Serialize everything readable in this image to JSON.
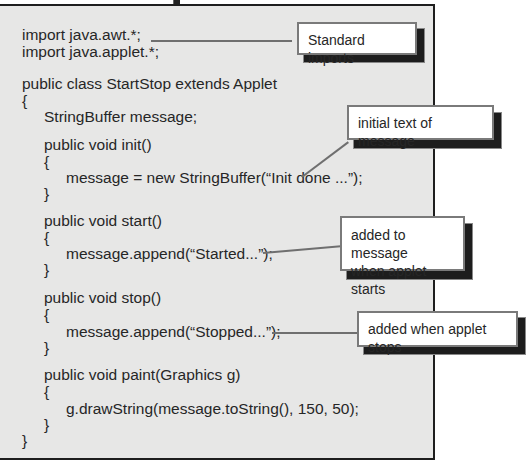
{
  "code": {
    "lines": [
      {
        "text": "import java.awt.*;",
        "indent": 0,
        "y": 35
      },
      {
        "text": "import java.applet.*;",
        "indent": 0,
        "y": 52
      },
      {
        "text": "public class StartStop extends Applet",
        "indent": 0,
        "y": 84
      },
      {
        "text": "{",
        "indent": 0,
        "y": 101
      },
      {
        "text": "StringBuffer message;",
        "indent": 1,
        "y": 117
      },
      {
        "text": "public void init()",
        "indent": 1,
        "y": 145
      },
      {
        "text": "{",
        "indent": 1,
        "y": 162
      },
      {
        "text": "message = new StringBuffer(“Init done ...”);",
        "indent": 2,
        "y": 178
      },
      {
        "text": "}",
        "indent": 1,
        "y": 194
      },
      {
        "text": "public void start()",
        "indent": 1,
        "y": 221
      },
      {
        "text": "{",
        "indent": 1,
        "y": 238
      },
      {
        "text": "message.append(“Started...”);",
        "indent": 2,
        "y": 254
      },
      {
        "text": "}",
        "indent": 1,
        "y": 270
      },
      {
        "text": "public void stop()",
        "indent": 1,
        "y": 298
      },
      {
        "text": "{",
        "indent": 1,
        "y": 315
      },
      {
        "text": "message.append(“Stopped...”);",
        "indent": 2,
        "y": 332
      },
      {
        "text": "}",
        "indent": 1,
        "y": 348
      },
      {
        "text": "public void paint(Graphics g)",
        "indent": 1,
        "y": 375
      },
      {
        "text": "{",
        "indent": 1,
        "y": 392
      },
      {
        "text": "g.drawString(message.toString(), 150, 50);",
        "indent": 2,
        "y": 409
      },
      {
        "text": "}",
        "indent": 1,
        "y": 425
      },
      {
        "text": "}",
        "indent": 0,
        "y": 441
      }
    ]
  },
  "callouts": {
    "imports": {
      "text": "Standard imports"
    },
    "init": {
      "text": "initial text of message"
    },
    "start": {
      "line1": "added to message",
      "line2": "when applet starts"
    },
    "stop": {
      "text": "added when applet stops"
    }
  },
  "colors": {
    "panel_bg": "#e7e7e6",
    "border": "#1e1e1e",
    "callout_border": "#7a7a7a",
    "callout_shadow": "#1d1d1d",
    "connector": "#6f6f6f"
  }
}
